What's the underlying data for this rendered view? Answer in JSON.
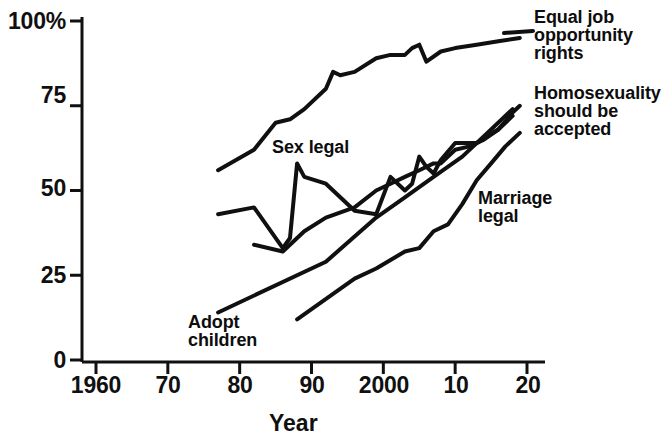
{
  "chart_data": {
    "type": "line",
    "title": "",
    "subtitle": "",
    "xlabel": "Year",
    "ylabel": "",
    "xlim": [
      1960,
      2020
    ],
    "ylim": [
      0,
      100
    ],
    "grid": false,
    "legend_position": "inline-annotations",
    "x_tick_labels": [
      "1960",
      "70",
      "80",
      "90",
      "2000",
      "10",
      "20"
    ],
    "x_tick_values": [
      1960,
      1970,
      1980,
      1990,
      2000,
      2010,
      2020
    ],
    "y_tick_labels": [
      "0",
      "25",
      "50",
      "75",
      "100%"
    ],
    "y_tick_values": [
      0,
      25,
      50,
      75,
      100
    ],
    "series": [
      {
        "name": "Equal job opportunity rights",
        "label_lines": [
          "Equal job",
          "opportunity",
          "rights"
        ],
        "x": [
          1977,
          1982,
          1985,
          1987,
          1989,
          1992,
          1993,
          1994,
          1996,
          1999,
          2001,
          2003,
          2004,
          2005,
          2006,
          2008,
          2010,
          2013,
          2016,
          2019
        ],
        "y": [
          56,
          62,
          70,
          71,
          74,
          80,
          85,
          84,
          85,
          89,
          90,
          90,
          92,
          93,
          88,
          91,
          92,
          93,
          94,
          95
        ]
      },
      {
        "name": "Sex legal",
        "label_lines": [
          "Sex legal"
        ],
        "x": [
          1977,
          1982,
          1986,
          1987,
          1988,
          1989,
          1992,
          1996,
          1999,
          2001,
          2003,
          2004,
          2005,
          2006,
          2007,
          2008,
          2010,
          2013,
          2016,
          2018
        ],
        "y": [
          43,
          45,
          33,
          36,
          58,
          54,
          52,
          44,
          43,
          54,
          50,
          52,
          60,
          57,
          55,
          59,
          64,
          64,
          68,
          72
        ]
      },
      {
        "name": "Homosexuality should be accepted",
        "label_lines": [
          "Homosexuality",
          "should be",
          "accepted"
        ],
        "x": [
          1982,
          1986,
          1989,
          1992,
          1996,
          1999,
          2001,
          2003,
          2005,
          2007,
          2008,
          2010,
          2012,
          2014,
          2016,
          2018,
          2019
        ],
        "y": [
          34,
          32,
          38,
          42,
          45,
          50,
          52,
          54,
          56,
          58,
          58,
          62,
          63,
          65,
          68,
          73,
          75
        ]
      },
      {
        "name": "Marriage legal",
        "label_lines": [
          "Marriage",
          "legal"
        ],
        "x": [
          1988,
          1996,
          1999,
          2003,
          2005,
          2007,
          2009,
          2011,
          2013,
          2015,
          2017,
          2019
        ],
        "y": [
          12,
          24,
          27,
          32,
          33,
          38,
          40,
          46,
          53,
          58,
          63,
          67
        ]
      },
      {
        "name": "Adopt children",
        "label_lines": [
          "Adopt",
          "children"
        ],
        "x": [
          1977,
          1992,
          1999,
          2003,
          2007,
          2011,
          2015,
          2018
        ],
        "y": [
          14,
          29,
          42,
          48,
          54,
          60,
          68,
          74
        ]
      }
    ]
  },
  "axis": {
    "x_title": "Year",
    "x_ticks": [
      {
        "label": "1960",
        "value": 1960
      },
      {
        "label": "70",
        "value": 1970
      },
      {
        "label": "80",
        "value": 1980
      },
      {
        "label": "90",
        "value": 1990
      },
      {
        "label": "2000",
        "value": 2000
      },
      {
        "label": "10",
        "value": 2010
      },
      {
        "label": "20",
        "value": 2020
      }
    ],
    "y_ticks": [
      {
        "label": "100%",
        "value": 100
      },
      {
        "label": "75",
        "value": 75
      },
      {
        "label": "50",
        "value": 50
      },
      {
        "label": "25",
        "value": 25
      },
      {
        "label": "0",
        "value": 0
      }
    ]
  },
  "annotations": {
    "equal_job": "Equal job\nopportunity\nrights",
    "homosexuality": "Homosexuality\nshould be\naccepted",
    "sex_legal": "Sex legal",
    "marriage_legal": "Marriage\nlegal",
    "adopt_children": "Adopt\nchildren"
  },
  "colors": {
    "line": "#101010",
    "axis": "#101010",
    "background": "#ffffff",
    "text": "#101010"
  }
}
